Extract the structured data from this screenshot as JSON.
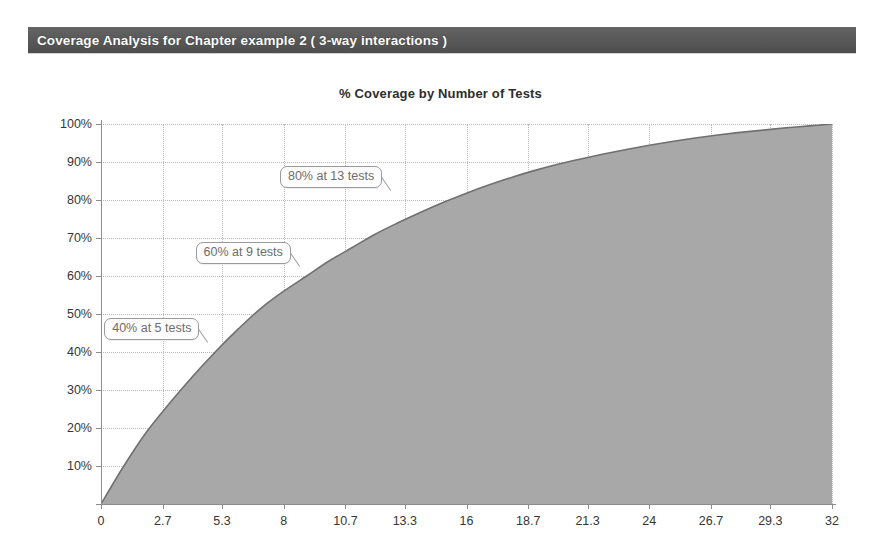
{
  "header": {
    "title": "Coverage Analysis for Chapter example 2  ( 3-way interactions )",
    "bar_color": "#5a5a5a",
    "text_color": "#ffffff"
  },
  "chart_data": {
    "type": "area",
    "title": "% Coverage by Number of Tests",
    "xlabel": "",
    "ylabel": "",
    "xlim": [
      0,
      32
    ],
    "ylim": [
      0,
      100
    ],
    "grid": true,
    "legend": "none",
    "fill_color": "#a8a8a8",
    "line_color": "#707070",
    "x_ticks": [
      "0",
      "2.7",
      "5.3",
      "8",
      "10.7",
      "13.3",
      "16",
      "18.7",
      "21.3",
      "24",
      "26.7",
      "29.3",
      "32"
    ],
    "x_tick_values": [
      0,
      2.7,
      5.3,
      8,
      10.7,
      13.3,
      16,
      18.7,
      21.3,
      24,
      26.7,
      29.3,
      32
    ],
    "y_ticks": [
      "10%",
      "20%",
      "30%",
      "40%",
      "50%",
      "60%",
      "70%",
      "80%",
      "90%",
      "100%"
    ],
    "y_tick_values": [
      10,
      20,
      30,
      40,
      50,
      60,
      70,
      80,
      90,
      100
    ],
    "x": [
      0,
      1,
      2,
      3,
      4,
      5,
      6,
      7,
      8,
      9,
      10,
      11,
      12,
      13,
      14,
      15,
      16,
      17,
      18,
      19,
      20,
      21,
      22,
      23,
      24,
      25,
      26,
      27,
      28,
      29,
      30,
      31,
      32
    ],
    "values": [
      0,
      10,
      19,
      26.5,
      33.5,
      40,
      46,
      51.5,
      56,
      60,
      64,
      67.5,
      71,
      74,
      76.8,
      79.4,
      81.8,
      84,
      86,
      87.8,
      89.4,
      90.8,
      92.1,
      93.3,
      94.4,
      95.4,
      96.3,
      97.1,
      97.8,
      98.4,
      99,
      99.5,
      100
    ],
    "annotations": [
      {
        "label": "40% at 5 tests",
        "x": 5,
        "y": 40
      },
      {
        "label": "60% at 9 tests",
        "x": 9,
        "y": 60
      },
      {
        "label": "80% at 13 tests",
        "x": 13,
        "y": 80
      }
    ]
  }
}
